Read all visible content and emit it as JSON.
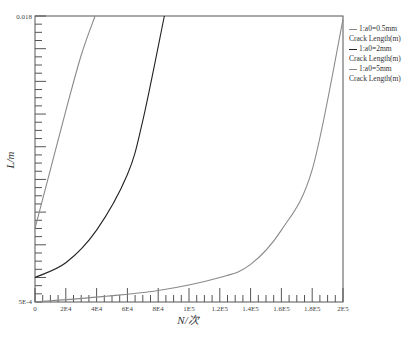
{
  "chart_data": {
    "type": "line",
    "title": "",
    "xlabel": "N/次",
    "ylabel": "L/m",
    "xlim": [
      0,
      200000
    ],
    "ylim": [
      0.0005,
      0.018
    ],
    "x_tick_labels": [
      "0",
      "2E4",
      "4E4",
      "6E4",
      "8E4",
      "1E5",
      "1.2E5",
      "1.4E5",
      "1.6E5",
      "1.8E5",
      "2E5"
    ],
    "y_tick_labels": [
      "5E-4",
      "0.018"
    ],
    "grid": false,
    "legend_position": "right",
    "series": [
      {
        "name": "1:a0=0.5mm Crack Length(m)",
        "color": "#8a8a8a",
        "x": [
          0,
          40000,
          80000,
          120000,
          140000,
          160000,
          180000,
          200000
        ],
        "y": [
          0.0005,
          0.0008,
          0.0012,
          0.002,
          0.0028,
          0.0049,
          0.0086,
          0.0178
        ]
      },
      {
        "name": "1:a0=2mm Crack Length(m)",
        "color": "#222222",
        "x": [
          0,
          20000,
          40000,
          60000,
          70000,
          84000
        ],
        "y": [
          0.002,
          0.0029,
          0.0049,
          0.0083,
          0.0116,
          0.018
        ]
      },
      {
        "name": "1:a0=5mm Crack Length(m)",
        "color": "#8a8a8a",
        "x": [
          0,
          10000,
          20000,
          30000,
          39000
        ],
        "y": [
          0.005,
          0.0086,
          0.0122,
          0.0156,
          0.018
        ]
      }
    ]
  },
  "legend": [
    {
      "line1": "1:a0=0.5mm",
      "line2": "Crack Length(m)",
      "color": "#8a8a8a"
    },
    {
      "line1": "1:a0=2mm",
      "line2": "Crack Length(m)",
      "color": "#222222"
    },
    {
      "line1": "1:a0=5mm",
      "line2": "Crack Length(m)",
      "color": "#8a8a8a"
    }
  ]
}
